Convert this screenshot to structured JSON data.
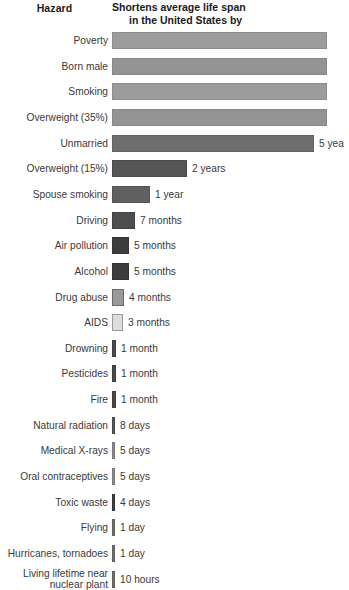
{
  "header": {
    "left_column_title": "Hazard",
    "right_column_title_line1": "Shortens average life span",
    "right_column_title_line2": "in the United States by"
  },
  "chart_data": {
    "type": "bar",
    "title": "Shortens average life span in the United States by",
    "xlabel": "",
    "ylabel": "Hazard",
    "orientation": "horizontal",
    "grid": false,
    "legend": null,
    "note": "Top four bars extend past the right edge of the visible image (clipped); the 'Unmarried' value label is clipped to '5 yea'.",
    "categories": [
      "Poverty",
      "Born male",
      "Smoking",
      "Overweight (35%)",
      "Unmarried",
      "Overweight (15%)",
      "Spouse smoking",
      "Driving",
      "Air pollution",
      "Alcohol",
      "Drug abuse",
      "AIDS",
      "Drowning",
      "Pesticides",
      "Fire",
      "Natural radiation",
      "Medical X-rays",
      "Oral contraceptives",
      "Toxic waste",
      "Flying",
      "Hurricanes, tornadoes",
      "Living lifetime near nuclear plant"
    ],
    "value_labels": [
      "",
      "",
      "",
      "",
      "5 yea",
      "2 years",
      "1 year",
      "7 months",
      "5 months",
      "5 months",
      "4 months",
      "3 months",
      "1 month",
      "1 month",
      "1 month",
      "8 days",
      "5 days",
      "5 days",
      "4 days",
      "1 day",
      "1 day",
      "10 hours"
    ],
    "values_days": [
      3285,
      3000,
      2555,
      2190,
      1825,
      730,
      365,
      213,
      152,
      152,
      122,
      91,
      30,
      30,
      30,
      8,
      5,
      5,
      4,
      1,
      1,
      0.42
    ],
    "rows": [
      {
        "label": "Poverty",
        "value_label": "",
        "bar_px": 215,
        "clipped": true,
        "fill": "#9c9c9c",
        "border": "#8e8e8e"
      },
      {
        "label": "Born male",
        "value_label": "",
        "bar_px": 215,
        "clipped": true,
        "fill": "#949494",
        "border": "#878787"
      },
      {
        "label": "Smoking",
        "value_label": "",
        "bar_px": 215,
        "clipped": true,
        "fill": "#9c9c9c",
        "border": "#8e8e8e"
      },
      {
        "label": "Overweight (35%)",
        "value_label": "",
        "bar_px": 215,
        "clipped": true,
        "fill": "#949494",
        "border": "#878787"
      },
      {
        "label": "Unmarried",
        "value_label": "5 yea",
        "bar_px": 202,
        "clipped": false,
        "fill": "#6e6e6e",
        "border": "#636363"
      },
      {
        "label": "Overweight (15%)",
        "value_label": "2 years",
        "bar_px": 75,
        "clipped": false,
        "fill": "#555555",
        "border": "#4a4a4a"
      },
      {
        "label": "Spouse smoking",
        "value_label": "1 year",
        "bar_px": 38,
        "clipped": false,
        "fill": "#606060",
        "border": "#545454"
      },
      {
        "label": "Driving",
        "value_label": "7 months",
        "bar_px": 23,
        "clipped": false,
        "fill": "#4d4d4d",
        "border": "#434343"
      },
      {
        "label": "Air pollution",
        "value_label": "5 months",
        "bar_px": 17,
        "clipped": false,
        "fill": "#3c3c3c",
        "border": "#343434"
      },
      {
        "label": "Alcohol",
        "value_label": "5 months",
        "bar_px": 17,
        "clipped": false,
        "fill": "#3c3c3c",
        "border": "#343434"
      },
      {
        "label": "Drug abuse",
        "value_label": "4 months",
        "bar_px": 12,
        "clipped": false,
        "fill": "#9a9a9a",
        "border": "#6a6a6a"
      },
      {
        "label": "AIDS",
        "value_label": "3 months",
        "bar_px": 11,
        "clipped": false,
        "fill": "#dcdcdc",
        "border": "#9a9a9a"
      },
      {
        "label": "Drowning",
        "value_label": "1 month",
        "bar_px": 4,
        "clipped": false,
        "fill": "#4a4a4a",
        "border": "#3c3c3c"
      },
      {
        "label": "Pesticides",
        "value_label": "1 month",
        "bar_px": 4,
        "clipped": false,
        "fill": "#4a4a4a",
        "border": "#3c3c3c"
      },
      {
        "label": "Fire",
        "value_label": "1 month",
        "bar_px": 4,
        "clipped": false,
        "fill": "#4a4a4a",
        "border": "#3c3c3c"
      },
      {
        "label": "Natural radiation",
        "value_label": "8 days",
        "bar_px": 3,
        "clipped": false,
        "fill": "#555555",
        "border": "#4a4a4a"
      },
      {
        "label": "Medical X-rays",
        "value_label": "5 days",
        "bar_px": 3,
        "clipped": false,
        "fill": "#8a8a8a",
        "border": "#7a7a7a"
      },
      {
        "label": "Oral contraceptives",
        "value_label": "5 days",
        "bar_px": 3,
        "clipped": false,
        "fill": "#8a8a8a",
        "border": "#7a7a7a"
      },
      {
        "label": "Toxic waste",
        "value_label": "4 days",
        "bar_px": 3,
        "clipped": false,
        "fill": "#3f3f3f",
        "border": "#353535"
      },
      {
        "label": "Flying",
        "value_label": "1 day",
        "bar_px": 3,
        "clipped": false,
        "fill": "#6f6f6f",
        "border": "#606060"
      },
      {
        "label": "Hurricanes, tornadoes",
        "value_label": "1 day",
        "bar_px": 3,
        "clipped": false,
        "fill": "#6f6f6f",
        "border": "#606060"
      },
      {
        "label": "Living lifetime near nuclear plant",
        "value_label": "10 hours",
        "bar_px": 3,
        "clipped": false,
        "fill": "#6f6f6f",
        "border": "#606060",
        "label_line1": "Living lifetime near",
        "label_line2": "nuclear plant"
      }
    ]
  },
  "colors": {
    "background": "#ffffff",
    "label_text": "#3a3a3a",
    "header_text": "#1b1b1b"
  }
}
